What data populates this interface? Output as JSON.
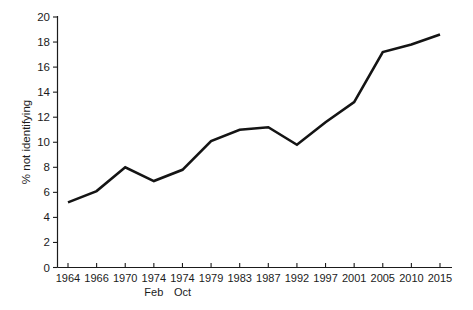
{
  "chart_data": {
    "type": "line",
    "title": "",
    "xlabel": "",
    "ylabel": "% not identifying",
    "ylim": [
      0,
      20
    ],
    "ytick_step": 2,
    "yticks": [
      "0",
      "2",
      "4",
      "6",
      "8",
      "10",
      "12",
      "14",
      "16",
      "18",
      "20"
    ],
    "grid": false,
    "legend": "none",
    "line_color": "#141414",
    "axis_color": "#1b1b1b",
    "categories": [
      "1964",
      "1966",
      "1970",
      "1974",
      "1974",
      "1979",
      "1983",
      "1987",
      "1992",
      "1997",
      "2001",
      "2005",
      "2010",
      "2015"
    ],
    "sub_labels": [
      "",
      "",
      "",
      "Feb",
      "Oct",
      "",
      "",
      "",
      "",
      "",
      "",
      "",
      "",
      ""
    ],
    "values": [
      5.2,
      6.1,
      8.0,
      6.9,
      7.8,
      10.1,
      11.0,
      11.2,
      9.8,
      11.6,
      13.2,
      17.2,
      17.8,
      18.6
    ],
    "series": [
      {
        "name": "% not identifying",
        "values": [
          5.2,
          6.1,
          8.0,
          6.9,
          7.8,
          10.1,
          11.0,
          11.2,
          9.8,
          11.6,
          13.2,
          17.2,
          17.8,
          18.6
        ]
      }
    ]
  }
}
